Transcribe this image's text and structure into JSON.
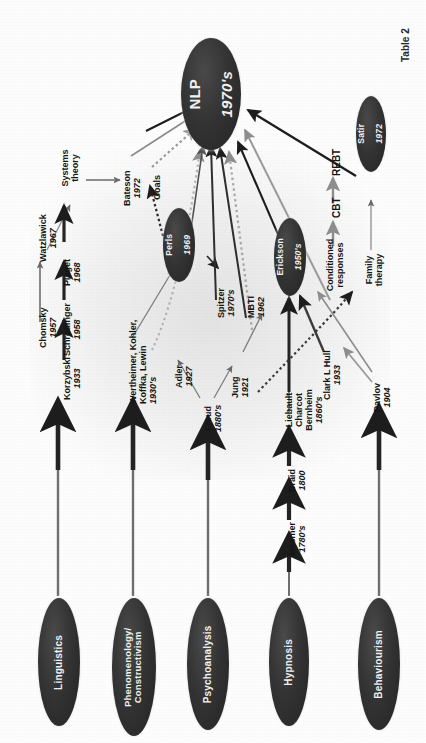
{
  "figure": {
    "caption": "Table 2",
    "hub": {
      "line1": "NLP",
      "line2": "1970's"
    }
  },
  "colors": {
    "oval_fill": "#2c2c2c",
    "oval_text": "#f2f2f2",
    "label_text": "#151515",
    "arrow_dark": "#1d1d1d",
    "arrow_mid": "#4f4f4f",
    "arrow_light": "#8e8e8e",
    "background": "#fdfdfd"
  },
  "roots": [
    {
      "id": "linguistics",
      "label": "Linguistics"
    },
    {
      "id": "phenomenology",
      "label": "Phenomenology/ Constructivism"
    },
    {
      "id": "psychoanalysis",
      "label": "Psychoanalysis"
    },
    {
      "id": "hypnosis",
      "label": "Hypnosis"
    },
    {
      "id": "behaviourism",
      "label": "Behaviourism"
    }
  ],
  "ovals": [
    {
      "id": "perls",
      "name": "Perls",
      "year": "1969"
    },
    {
      "id": "erickson",
      "name": "Erickson",
      "year": "1950's"
    },
    {
      "id": "satir",
      "name": "Satir",
      "year": "1972"
    }
  ],
  "nodes": [
    {
      "id": "chomsky",
      "name": "Chomsky",
      "year": "1957"
    },
    {
      "id": "watzlawick",
      "name": "Watzlawick",
      "year": "1967"
    },
    {
      "id": "korzybski",
      "name": "Korzybski",
      "year": "1933"
    },
    {
      "id": "schrodinger",
      "name": "Schrodinger",
      "year": "1958"
    },
    {
      "id": "piaget",
      "name": "Piaget",
      "year": "1968"
    },
    {
      "id": "systems",
      "name": "Systems theory",
      "year": ""
    },
    {
      "id": "bateson",
      "name": "Bateson",
      "year": "1972"
    },
    {
      "id": "goals",
      "name": "Goals",
      "year": ""
    },
    {
      "id": "gestalt",
      "name": "Wertheimer, Kohler, Koffka, Lewin",
      "year": "1930's"
    },
    {
      "id": "adler",
      "name": "Adler",
      "year": "1927"
    },
    {
      "id": "freud",
      "name": "Freud",
      "year": "1880's"
    },
    {
      "id": "jung",
      "name": "Jung",
      "year": "1921"
    },
    {
      "id": "spitzer",
      "name": "Spitzer",
      "year": "1970's"
    },
    {
      "id": "mbti",
      "name": "MBTI",
      "year": "1962"
    },
    {
      "id": "mesmer",
      "name": "Mesmer",
      "year": "1780's"
    },
    {
      "id": "braid",
      "name": "Braid",
      "year": "1800"
    },
    {
      "id": "lcb",
      "name": "Liebault Charcot Bernheim",
      "year": "1860's"
    },
    {
      "id": "hull",
      "name": "Clark L Hull",
      "year": "1933"
    },
    {
      "id": "pavlov",
      "name": "Pavlov",
      "year": "1904"
    },
    {
      "id": "conditioned",
      "name": "Conditioned responses",
      "year": ""
    },
    {
      "id": "cbt",
      "name": "CBT",
      "year": ""
    },
    {
      "id": "rebt",
      "name": "REBT",
      "year": ""
    },
    {
      "id": "family",
      "name": "Family therapy",
      "year": ""
    }
  ]
}
